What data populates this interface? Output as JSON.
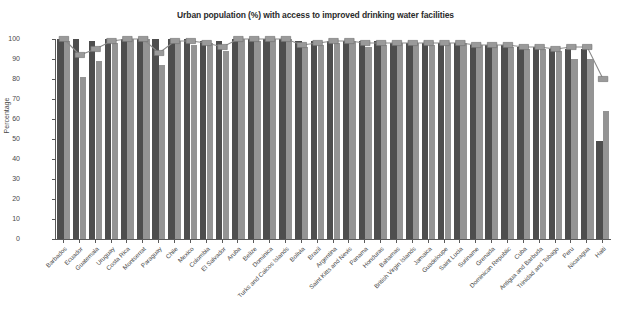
{
  "chart": {
    "title": "Urban population (%) with access to improved drinking water facilities",
    "ylabel": "Percentage"
  },
  "chart_data": {
    "type": "bar",
    "title": "Urban population (%) with access to improved drinking water facilities",
    "xlabel": "",
    "ylabel": "Percentage",
    "ylim": [
      0,
      100
    ],
    "ytick_labels": [
      "0",
      "10",
      "20",
      "30",
      "40",
      "50",
      "60",
      "70",
      "80",
      "90",
      "100"
    ],
    "yticks": [
      0,
      10,
      20,
      30,
      40,
      50,
      60,
      70,
      80,
      90,
      100
    ],
    "grid": false,
    "legend": "none",
    "colors": {
      "series1": "#4e4e4e",
      "series2": "#949494",
      "line": "#8a8a8a"
    },
    "categories": [
      "Barbados",
      "Ecuador",
      "Guatemala",
      "Uruguay",
      "Costa Rica",
      "Montserrat",
      "Paraguay",
      "Chile",
      "Mexico",
      "Colombia",
      "El Salvador",
      "Aruba",
      "Belize",
      "Dominica",
      "Turks and Caicos Islands",
      "Bolivia",
      "Brazil",
      "Argentina",
      "Saint Kitts and Nevis",
      "Panama",
      "Honduras",
      "Bahamas",
      "British Virgin Islands",
      "Jamaica",
      "Guadeloupe",
      "Saint Lucia",
      "Suriname",
      "Grenada",
      "Dominican Republic",
      "Cuba",
      "Antigua and Barbuda",
      "Trinidad and Tobago",
      "Peru",
      "Nicaragua",
      "Haiti"
    ],
    "series": [
      {
        "name": "Series 1",
        "values": [
          100,
          100,
          99,
          100,
          100,
          100,
          100,
          100,
          100,
          99,
          99,
          100,
          100,
          100,
          100,
          99,
          99,
          99,
          99,
          99,
          99,
          98,
          98,
          98,
          98,
          98,
          97,
          97,
          97,
          96,
          96,
          95,
          95,
          95,
          49
        ]
      },
      {
        "name": "Series 2",
        "values": [
          99,
          81,
          89,
          98,
          100,
          100,
          87,
          99,
          97,
          98,
          94,
          100,
          99,
          100,
          100,
          96,
          97,
          98,
          99,
          96,
          97,
          98,
          98,
          97,
          98,
          98,
          97,
          97,
          96,
          95,
          95,
          94,
          90,
          90,
          64
        ]
      },
      {
        "name": "Series 3",
        "values": [
          100,
          92,
          95,
          99,
          100,
          100,
          93,
          99,
          99,
          98,
          96,
          100,
          100,
          100,
          100,
          97,
          98,
          99,
          99,
          98,
          98,
          98,
          98,
          98,
          98,
          98,
          97,
          97,
          97,
          96,
          96,
          95,
          96,
          96,
          80
        ]
      }
    ]
  }
}
